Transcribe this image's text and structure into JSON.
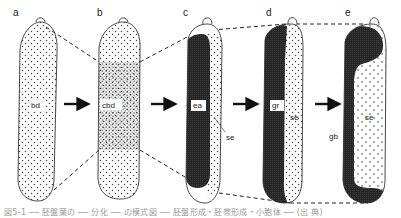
{
  "figure": {
    "panels": [
      {
        "letter": "a",
        "region_label": "bd"
      },
      {
        "letter": "b",
        "region_label": "cbd"
      },
      {
        "letter": "c",
        "region_label": "ea",
        "secondary_label": "se"
      },
      {
        "letter": "d",
        "region_label": "gr",
        "secondary_label": "se"
      },
      {
        "letter": "e",
        "region_label": "se",
        "secondary_label": "gb"
      }
    ],
    "arrows": 4,
    "colors": {
      "outline": "#333333",
      "dark_fill": "#2b2b2b",
      "stipple": "#444444",
      "dashed": "#222222",
      "background": "#ffffff"
    }
  },
  "caption": {
    "text": "図5-1 ── 胚盤葉の ── 分化 ── の模式図 ── 胚盤形成・胚帯形成・小胞体 ── (出 典)"
  }
}
